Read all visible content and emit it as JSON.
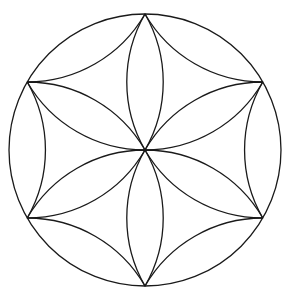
{
  "diagram": {
    "title": "",
    "type": "hexafoil-rosette",
    "stroke_color": "#1a1a1a",
    "background_color": "#ffffff",
    "center": [
      145,
      150
    ],
    "radius": 136,
    "vertex_count": 6,
    "labels": []
  }
}
